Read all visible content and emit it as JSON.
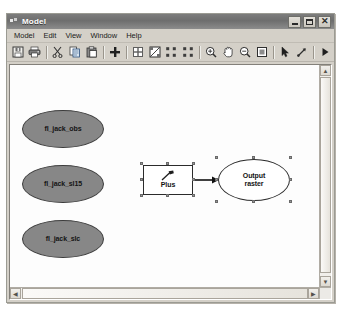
{
  "window": {
    "title": "Model",
    "title_icon": "model-document-icon",
    "buttons": {
      "minimize": "Minimize",
      "maximize": "Maximize",
      "close": "Close"
    }
  },
  "menu": {
    "items": [
      {
        "label": "Model"
      },
      {
        "label": "Edit"
      },
      {
        "label": "View"
      },
      {
        "label": "Window"
      },
      {
        "label": "Help"
      }
    ]
  },
  "toolbar": {
    "items": [
      {
        "name": "save-icon",
        "title": "Save"
      },
      {
        "name": "print-icon",
        "title": "Print"
      },
      {
        "name": "cut-icon",
        "title": "Cut"
      },
      {
        "name": "copy-icon",
        "title": "Copy"
      },
      {
        "name": "paste-icon",
        "title": "Paste"
      },
      {
        "name": "add-data-icon",
        "title": "Add Data"
      },
      {
        "name": "auto-layout-icon",
        "title": "Auto Layout"
      },
      {
        "name": "full-view-icon",
        "title": "Full View"
      },
      {
        "name": "diagram-properties-icon",
        "title": "Diagram Properties"
      },
      {
        "name": "model-elements-icon",
        "title": "Model Elements"
      },
      {
        "name": "zoom-in-icon",
        "title": "Zoom In"
      },
      {
        "name": "pan-icon",
        "title": "Pan"
      },
      {
        "name": "zoom-out-icon",
        "title": "Zoom Out"
      },
      {
        "name": "zoom-whole-page-icon",
        "title": "Zoom Whole Page"
      },
      {
        "name": "select-arrow-icon",
        "title": "Select"
      },
      {
        "name": "connect-icon",
        "title": "Connect"
      },
      {
        "name": "run-icon",
        "title": "Run"
      }
    ]
  },
  "canvas": {
    "inputs": [
      {
        "label": "fl_jack_obs",
        "type": "data-variable"
      },
      {
        "label": "fl_jack_sl15",
        "type": "data-variable"
      },
      {
        "label": "fl_jack_slc",
        "type": "data-variable"
      }
    ],
    "tool": {
      "label": "Plus",
      "icon": "hammer-icon",
      "selected": true
    },
    "output": {
      "label_line1": "Output",
      "label_line2": "raster",
      "selected": true
    },
    "colors": {
      "data_variable_fill": "#878787",
      "tool_fill": "#ffffff",
      "output_fill": "#ffffff",
      "outline": "#2b2b2b",
      "selection_handle": "#9a9a9a"
    }
  },
  "scrollbars": {
    "vertical": {
      "up": "▲",
      "down": "▼"
    },
    "horizontal": {
      "left": "◀",
      "right": "▶"
    }
  }
}
